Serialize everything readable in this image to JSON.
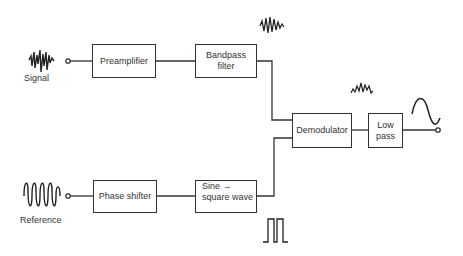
{
  "diagram": {
    "type": "block-diagram",
    "inputs": {
      "signal": {
        "label": "Signal",
        "icon": "noisy-signal-waveform-icon"
      },
      "reference": {
        "label": "Reference",
        "icon": "sine-waveform-icon"
      }
    },
    "blocks": {
      "preamplifier": {
        "line1": "Preamplifier"
      },
      "bandpass": {
        "line1": "Bandpass",
        "line2": "filter"
      },
      "phase_shifter": {
        "line1": "Phase shifter"
      },
      "sine_square": {
        "line1": "Sine →",
        "line2": "square wave"
      },
      "demodulator": {
        "line1": "Demodulator"
      },
      "lowpass": {
        "line1": "Low",
        "line2": "pass"
      }
    },
    "waveforms": {
      "after_bandpass": "filtered-burst-waveform-icon",
      "after_square": "square-pulse-waveform-icon",
      "after_demodulator": "rectified-waveform-icon",
      "output": "sine-output-waveform-icon"
    },
    "stroke_color": "#333333"
  }
}
